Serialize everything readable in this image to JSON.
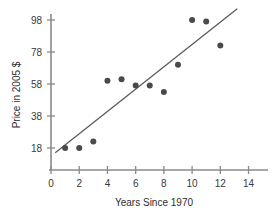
{
  "chart_data": {
    "type": "scatter",
    "title": "",
    "xlabel": "Years Since 1970",
    "ylabel": "Price in 2005 $",
    "xlim": [
      0,
      14.6
    ],
    "ylim": [
      10,
      106
    ],
    "grid": false,
    "legend": null,
    "xticks": [
      0,
      2,
      4,
      6,
      8,
      10,
      12,
      14
    ],
    "xtick_labels": [
      "0",
      "2",
      "4",
      "6",
      "8",
      "10",
      "12",
      "14"
    ],
    "yticks": [
      18,
      38,
      58,
      78,
      98
    ],
    "ytick_labels": [
      "18",
      "38",
      "58",
      "78",
      "98"
    ],
    "point_color": "#4a4a4a",
    "line_color": "#5b5b5b",
    "axis_color": "#8a8a8a",
    "series": [
      {
        "name": "Price observations",
        "points": [
          {
            "x": 1,
            "y": 18
          },
          {
            "x": 2,
            "y": 18
          },
          {
            "x": 3,
            "y": 22
          },
          {
            "x": 4,
            "y": 60
          },
          {
            "x": 5,
            "y": 61
          },
          {
            "x": 6,
            "y": 57
          },
          {
            "x": 7,
            "y": 57
          },
          {
            "x": 8,
            "y": 53
          },
          {
            "x": 9,
            "y": 70
          },
          {
            "x": 10,
            "y": 98
          },
          {
            "x": 11,
            "y": 97
          },
          {
            "x": 12,
            "y": 82
          }
        ]
      }
    ],
    "trend_line": {
      "name": "least-squares regression line",
      "x_start": 0.3,
      "y_start": 15,
      "x_end": 13.2,
      "y_end": 105
    }
  }
}
